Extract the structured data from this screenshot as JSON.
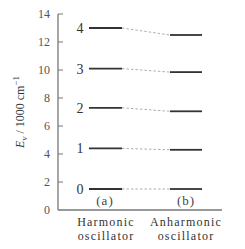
{
  "chart_data": {
    "type": "energy-level-diagram",
    "title": "",
    "ylabel": "E_v / 1000 cm^-1",
    "ylabel_parts": {
      "main": "E",
      "sub": "v",
      "rest": " / 1000 cm",
      "sup": "−1"
    },
    "ylim": [
      0,
      14
    ],
    "yticks": [
      0,
      2,
      4,
      6,
      8,
      10,
      12,
      14
    ],
    "series": [
      {
        "name": "Harmonic oscillator",
        "panel": "(a)",
        "levels": [
          {
            "v": 0,
            "energy": 1.5
          },
          {
            "v": 1,
            "energy": 4.4
          },
          {
            "v": 2,
            "energy": 7.3
          },
          {
            "v": 3,
            "energy": 10.1
          },
          {
            "v": 4,
            "energy": 13.0
          }
        ]
      },
      {
        "name": "Anharmonic oscillator",
        "panel": "(b)",
        "levels": [
          {
            "v": 0,
            "energy": 1.5
          },
          {
            "v": 1,
            "energy": 4.3
          },
          {
            "v": 2,
            "energy": 7.05
          },
          {
            "v": 3,
            "energy": 9.85
          },
          {
            "v": 4,
            "energy": 12.5
          }
        ]
      }
    ],
    "connectors": "dashed lines linking corresponding v levels"
  },
  "labels": {
    "y_main": "E",
    "y_sub": "v",
    "y_rest": " / 1000 cm",
    "y_sup": "−1",
    "x_left_line1": "Harmonic",
    "x_left_line2": "oscillator",
    "x_right_line1": "Anharmonic",
    "x_right_line2": "oscillator",
    "panel_a": "(a)",
    "panel_b": "(b)"
  }
}
